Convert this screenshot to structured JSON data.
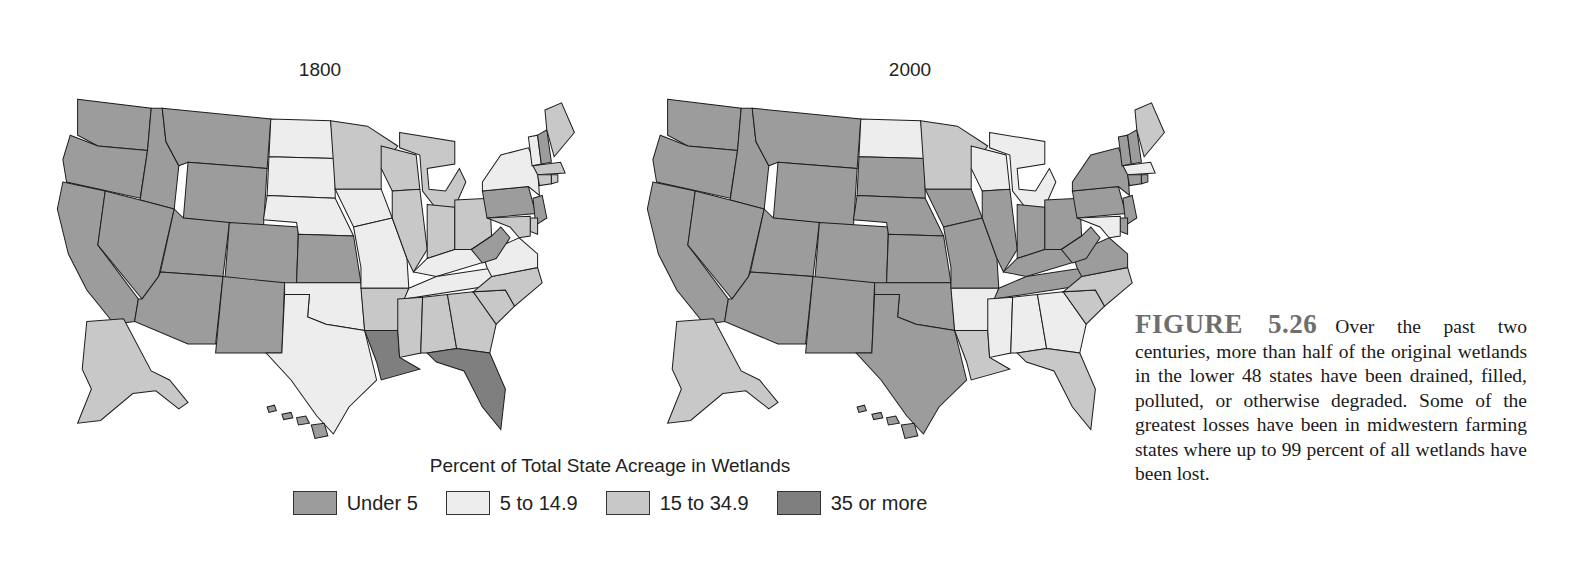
{
  "figure": {
    "label": "FIGURE 5.26",
    "caption": "Over the past two centuries, more than half of the original wetlands in the lower 48 states have been drained, filled, polluted, or otherwise degraded. Some of the greatest losses have been in midwestern farming states where up to 99 percent of all wetlands have been lost."
  },
  "legend": {
    "title": "Percent of Total State Acreage in Wetlands",
    "categories": [
      {
        "key": "under5",
        "label": "Under 5",
        "color": "#9c9c9c"
      },
      {
        "key": "5to15",
        "label": "5 to 14.9",
        "color": "#ededed"
      },
      {
        "key": "15to35",
        "label": "15 to 34.9",
        "color": "#c8c8c8"
      },
      {
        "key": "35plus",
        "label": "35 or more",
        "color": "#7f7f7f"
      }
    ]
  },
  "maps": [
    {
      "title": "1800",
      "states": {
        "WA": "under5",
        "OR": "under5",
        "CA": "under5",
        "ID": "under5",
        "NV": "under5",
        "MT": "under5",
        "WY": "under5",
        "UT": "under5",
        "AZ": "under5",
        "CO": "under5",
        "NM": "under5",
        "ND": "5to15",
        "SD": "5to15",
        "NE": "5to15",
        "KS": "under5",
        "OK": "5to15",
        "TX": "5to15",
        "MN": "15to35",
        "IA": "5to15",
        "MO": "5to15",
        "AR": "15to35",
        "LA": "35plus",
        "WI": "15to35",
        "IL": "15to35",
        "MI": "15to35",
        "IN": "15to35",
        "OH": "15to35",
        "KY": "5to15",
        "TN": "5to15",
        "MS": "15to35",
        "AL": "15to35",
        "GA": "15to35",
        "FL": "35plus",
        "SC": "15to35",
        "NC": "15to35",
        "VA": "5to15",
        "WV": "under5",
        "PA": "under5",
        "NY": "5to15",
        "VT": "5to15",
        "NH": "under5",
        "ME": "15to35",
        "MA": "15to35",
        "CT": "15to35",
        "RI": "15to35",
        "NJ": "under5",
        "DE": "15to35",
        "MD": "15to35",
        "AK": "15to35",
        "HI": "under5"
      }
    },
    {
      "title": "2000",
      "states": {
        "WA": "under5",
        "OR": "under5",
        "CA": "under5",
        "ID": "under5",
        "NV": "under5",
        "MT": "under5",
        "WY": "under5",
        "UT": "under5",
        "AZ": "under5",
        "CO": "under5",
        "NM": "under5",
        "ND": "5to15",
        "SD": "under5",
        "NE": "under5",
        "KS": "under5",
        "OK": "under5",
        "TX": "under5",
        "MN": "15to35",
        "IA": "under5",
        "MO": "under5",
        "AR": "5to15",
        "LA": "15to35",
        "WI": "5to15",
        "IL": "under5",
        "MI": "5to15",
        "IN": "under5",
        "OH": "under5",
        "KY": "under5",
        "TN": "under5",
        "MS": "5to15",
        "AL": "5to15",
        "GA": "5to15",
        "FL": "15to35",
        "SC": "15to35",
        "NC": "15to35",
        "VA": "under5",
        "WV": "under5",
        "PA": "under5",
        "NY": "under5",
        "VT": "under5",
        "NH": "under5",
        "ME": "15to35",
        "MA": "5to15",
        "CT": "under5",
        "RI": "under5",
        "NJ": "under5",
        "DE": "under5",
        "MD": "5to15",
        "AK": "15to35",
        "HI": "under5"
      }
    }
  ]
}
